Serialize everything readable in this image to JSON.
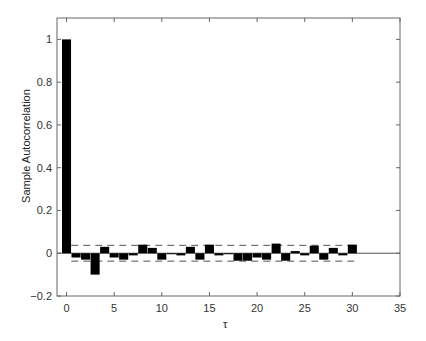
{
  "chart_data": {
    "type": "bar",
    "title": "",
    "xlabel": "τ",
    "ylabel": "Sample Autocorrelation",
    "xlim": [
      -1,
      35
    ],
    "ylim": [
      -0.2,
      1.1
    ],
    "xticks": [
      0,
      5,
      10,
      15,
      20,
      25,
      30,
      35
    ],
    "yticks": [
      -0.2,
      0,
      0.2,
      0.4,
      0.6,
      0.8,
      1
    ],
    "ytick_labels": [
      "−0.2",
      "0",
      "0.2",
      "0.4",
      "0.6",
      "0.8",
      "1"
    ],
    "grid": false,
    "legend": null,
    "x": [
      0,
      1,
      2,
      3,
      4,
      5,
      6,
      7,
      8,
      9,
      10,
      11,
      12,
      13,
      14,
      15,
      16,
      17,
      18,
      19,
      20,
      21,
      22,
      23,
      24,
      25,
      26,
      27,
      28,
      29,
      30
    ],
    "values": [
      1.0,
      -0.02,
      -0.03,
      -0.1,
      0.03,
      -0.02,
      -0.03,
      -0.01,
      0.04,
      0.025,
      -0.03,
      0.0,
      -0.01,
      0.03,
      -0.03,
      0.04,
      -0.01,
      0.0,
      -0.035,
      -0.035,
      -0.02,
      -0.03,
      0.045,
      -0.035,
      0.01,
      -0.01,
      0.035,
      -0.03,
      0.025,
      -0.01,
      0.04
    ],
    "confidence_bounds": [
      -0.037,
      0.037
    ],
    "bar_color": "#000000",
    "bound_style": "dashed"
  }
}
